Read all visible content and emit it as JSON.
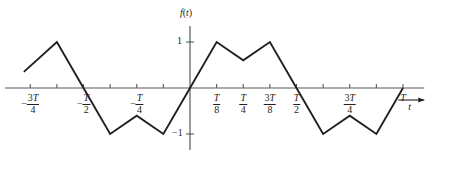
{
  "chart_data": {
    "type": "line",
    "title": "",
    "xlabel": "t",
    "ylabel": "f(t)",
    "grid": false,
    "legend": null,
    "xlim": [
      -0.8125,
      1.0625
    ],
    "ylim": [
      -1.35,
      1.35
    ],
    "yticks": [
      {
        "value": 1,
        "label": "1"
      },
      {
        "value": -1,
        "label": "-1"
      }
    ],
    "xticks": [
      {
        "value": -0.75,
        "label": "-3T/4",
        "sign": "-",
        "num": "3T",
        "den": "4"
      },
      {
        "value": -0.625,
        "label": "",
        "sign": "",
        "num": "",
        "den": ""
      },
      {
        "value": -0.5,
        "label": "-T/2",
        "sign": "-",
        "num": "T",
        "den": "2"
      },
      {
        "value": -0.375,
        "label": "",
        "sign": "",
        "num": "",
        "den": ""
      },
      {
        "value": -0.25,
        "label": "-T/4",
        "sign": "-",
        "num": "T",
        "den": "4"
      },
      {
        "value": -0.125,
        "label": "",
        "sign": "",
        "num": "",
        "den": ""
      },
      {
        "value": 0.125,
        "label": "T/8",
        "sign": "",
        "num": "T",
        "den": "8"
      },
      {
        "value": 0.25,
        "label": "T/4",
        "sign": "",
        "num": "T",
        "den": "4"
      },
      {
        "value": 0.375,
        "label": "3T/8",
        "sign": "",
        "num": "3T",
        "den": "8"
      },
      {
        "value": 0.5,
        "label": "T/2",
        "sign": "",
        "num": "T",
        "den": "2"
      },
      {
        "value": 0.625,
        "label": "",
        "sign": "",
        "num": "",
        "den": ""
      },
      {
        "value": 0.75,
        "label": "3T/4",
        "sign": "",
        "num": "3T",
        "den": "4"
      },
      {
        "value": 0.875,
        "label": "",
        "sign": "",
        "num": "",
        "den": ""
      },
      {
        "value": 1.0,
        "label": "T",
        "sign": "",
        "num": "T",
        "den": ""
      }
    ],
    "series": [
      {
        "name": "f(t)",
        "x": [
          -0.78,
          -0.625,
          -0.5,
          -0.375,
          -0.25,
          -0.125,
          0,
          0.125,
          0.25,
          0.375,
          0.5,
          0.625,
          0.75,
          0.875,
          1.0
        ],
        "y": [
          0.35,
          1.0,
          0.0,
          -1.0,
          -0.6,
          -1.0,
          0,
          1.0,
          0.6,
          1.0,
          0.0,
          -1.0,
          -0.6,
          -1.0,
          0.0
        ]
      }
    ],
    "axis_color": "#58595b",
    "curve_color": "#231f20",
    "text_color": "#231f20"
  },
  "labels": {
    "y_axis_name": "f(t)",
    "x_axis_name": "t",
    "y_top": "1",
    "y_bottom": "-1",
    "t_plain": "T",
    "minus": "−"
  }
}
